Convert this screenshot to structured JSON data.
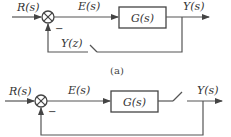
{
  "diagrams": [
    {
      "caption": "(a)",
      "input_label": "R(s)",
      "error_label": "E(s)",
      "block_label": "G(s)",
      "output_label": "Y(s)",
      "feedback_label": "Y(z)",
      "feedback_sign": "−",
      "switch_location": "feedback path"
    },
    {
      "caption": "",
      "input_label": "R(s)",
      "error_label": "E(s)",
      "block_label": "G(s)",
      "output_label": "Y(s)",
      "feedback_sign": "−",
      "switch_location": "forward path after G(s)"
    }
  ],
  "colors": {
    "line": "#555555",
    "text": "#333333",
    "background": "#ffffff"
  }
}
